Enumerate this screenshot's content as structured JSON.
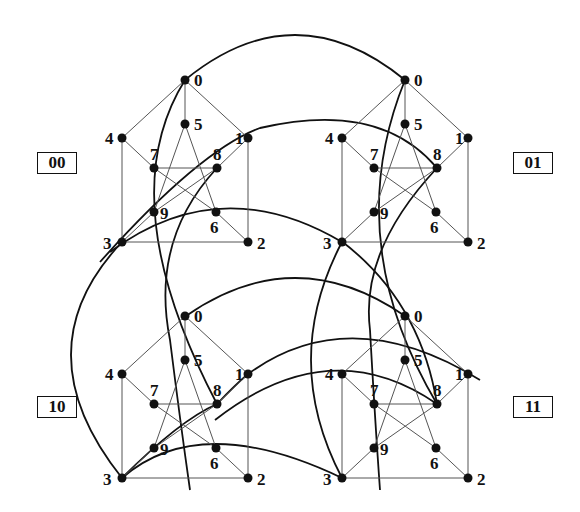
{
  "diagram": {
    "type": "graph",
    "copies": [
      {
        "label": "00",
        "offset": [
          0,
          0
        ]
      },
      {
        "label": "01",
        "offset": [
          220,
          0
        ]
      },
      {
        "label": "10",
        "offset": [
          0,
          236
        ]
      },
      {
        "label": "11",
        "offset": [
          220,
          236
        ]
      }
    ],
    "vertices": [
      {
        "id": "0",
        "x": 185,
        "y": 80,
        "lx": 9,
        "ly": 6
      },
      {
        "id": "5",
        "x": 185,
        "y": 124,
        "lx": 9,
        "ly": 6
      },
      {
        "id": "4",
        "x": 122,
        "y": 138,
        "lx": -17,
        "ly": 6
      },
      {
        "id": "1",
        "x": 248,
        "y": 138,
        "lx": -13,
        "ly": 6
      },
      {
        "id": "7",
        "x": 154,
        "y": 168,
        "lx": -4,
        "ly": -8
      },
      {
        "id": "8",
        "x": 217,
        "y": 168,
        "lx": -4,
        "ly": -8
      },
      {
        "id": "9",
        "x": 154,
        "y": 212,
        "lx": 6,
        "ly": 7
      },
      {
        "id": "6",
        "x": 216,
        "y": 212,
        "lx": -6,
        "ly": 21
      },
      {
        "id": "3",
        "x": 122,
        "y": 242,
        "lx": -19,
        "ly": 7
      },
      {
        "id": "2",
        "x": 248,
        "y": 242,
        "lx": 9,
        "ly": 7
      }
    ],
    "edges": [
      [
        "0",
        "4"
      ],
      [
        "0",
        "1"
      ],
      [
        "0",
        "5"
      ],
      [
        "4",
        "3"
      ],
      [
        "1",
        "2"
      ],
      [
        "3",
        "2"
      ],
      [
        "4",
        "7"
      ],
      [
        "7",
        "6"
      ],
      [
        "6",
        "2"
      ],
      [
        "7",
        "8"
      ],
      [
        "5",
        "9"
      ],
      [
        "5",
        "6"
      ],
      [
        "9",
        "8"
      ],
      [
        "3",
        "9"
      ],
      [
        "1",
        "8"
      ]
    ],
    "labels": [
      "00",
      "01",
      "10",
      "11"
    ],
    "colors": {
      "ink": "#111111",
      "thin_edge": "#555555",
      "background": "#ffffff"
    }
  }
}
